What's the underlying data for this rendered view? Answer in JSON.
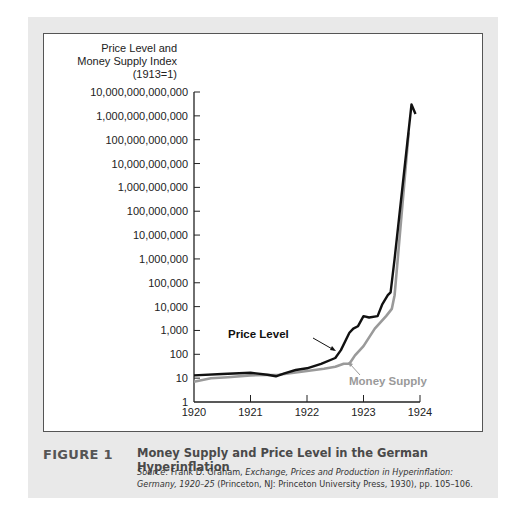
{
  "figure": {
    "label": "FIGURE 1",
    "title": "Money Supply and Price Level in the German Hyperinflation",
    "source_prefix": "Source",
    "source_author": ": Frank D. Graham, ",
    "source_book": "Exchange, Prices and Production in Hyperinflation: Germany, 1920–25",
    "source_rest": " (Princeton, NJ: Princeton University Press, 1930), pp. 105–106."
  },
  "chart_data": {
    "type": "line",
    "title": "Money Supply and Price Level in the German Hyperinflation",
    "ylabel_lines": [
      "Price Level and",
      "Money Supply Index",
      "(1913=1)"
    ],
    "xlabel": "",
    "yscale": "log",
    "ylim": [
      1,
      10000000000000
    ],
    "xlim": [
      1920,
      1924
    ],
    "x_ticks": [
      "1920",
      "1921",
      "1922",
      "1923",
      "1924"
    ],
    "y_ticks": [
      "1",
      "10",
      "100",
      "1,000",
      "10,000",
      "100,000",
      "1,000,000",
      "10,000,000",
      "100,000,000",
      "1,000,000,000",
      "10,000,000,000",
      "100,000,000,000",
      "1,000,000,000,000",
      "10,000,000,000,000"
    ],
    "grid": false,
    "series": [
      {
        "name": "Price Level",
        "color": "#111111",
        "x": [
          1920.0,
          1920.5,
          1921.0,
          1921.3,
          1921.45,
          1921.6,
          1921.8,
          1922.0,
          1922.25,
          1922.5,
          1922.6,
          1922.75,
          1922.82,
          1922.9,
          1923.0,
          1923.1,
          1923.25,
          1923.33,
          1923.43,
          1923.48,
          1923.55,
          1923.85,
          1923.92
        ],
        "values": [
          13,
          15,
          17,
          14,
          12,
          16,
          22,
          26,
          40,
          70,
          150,
          800,
          1200,
          1500,
          4000,
          3500,
          4000,
          12000,
          30000,
          40000,
          1000000,
          3000000000000,
          1200000000000
        ]
      },
      {
        "name": "Money Supply",
        "color": "#9a9a9a",
        "x": [
          1920.0,
          1920.3,
          1920.6,
          1921.0,
          1921.5,
          1922.0,
          1922.3,
          1922.5,
          1922.65,
          1922.75,
          1922.85,
          1923.0,
          1923.2,
          1923.4,
          1923.5,
          1923.55,
          1923.8
        ],
        "values": [
          7,
          10,
          11,
          13,
          14,
          20,
          25,
          30,
          40,
          40,
          90,
          220,
          1200,
          4000,
          8000,
          30000,
          200000000000
        ]
      }
    ],
    "annotations": [
      {
        "text": "Price Level",
        "points_to": "Price Level"
      },
      {
        "text": "Money Supply",
        "points_to": "Money Supply"
      }
    ]
  }
}
